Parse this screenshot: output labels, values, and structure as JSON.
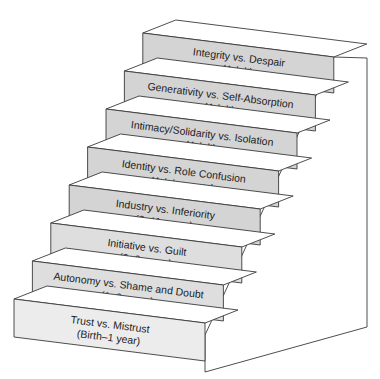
{
  "diagram": {
    "colors": {
      "front_upper": "#d4d4d4",
      "front_lower": "#dedede",
      "front_bottom": "#ececec",
      "tread": "#ffffff",
      "stroke": "#3a3a3a",
      "wall": "#ffffff"
    },
    "steps": [
      {
        "stage": "Trust vs. Mistrust",
        "age": "(Birth–1 year)"
      },
      {
        "stage": "Autonomy vs. Shame and Doubt",
        "age": "(1–3 years)"
      },
      {
        "stage": "Initiative vs. Guilt",
        "age": "(3–6 years)"
      },
      {
        "stage": "Industry vs. Inferiority",
        "age": "(6–11 years)"
      },
      {
        "stage": "Identity vs. Role Confusion",
        "age": "(Adolescents)"
      },
      {
        "stage": "Intimacy/Solidarity vs. Isolation",
        "age": "(Adult)"
      },
      {
        "stage": "Generativity vs. Self-Absorption",
        "age": "(Adult)"
      },
      {
        "stage": "Integrity vs. Despair",
        "age": "(Adult)"
      }
    ]
  }
}
